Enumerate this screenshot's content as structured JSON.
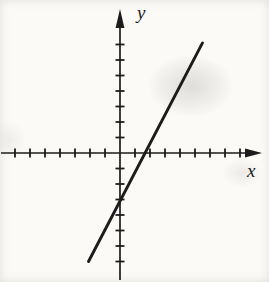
{
  "chart_data": {
    "type": "line",
    "title": "",
    "xlabel": "x",
    "ylabel": "y",
    "x_tick_range": [
      -7,
      8
    ],
    "y_tick_range": [
      -7,
      7
    ],
    "tick_step": 1,
    "tick_labels_shown": false,
    "grid": false,
    "legend": "none",
    "line": {
      "slope": 2,
      "y_intercept": -3,
      "x_intercept": 1.5,
      "equation": "y = 2x - 3",
      "segment_endpoints": [
        [
          -2.1,
          -7.0
        ],
        [
          5.5,
          7.1
        ]
      ]
    },
    "colors": {
      "ink": "#1c1c1c",
      "background": "#fbfaf7"
    }
  }
}
